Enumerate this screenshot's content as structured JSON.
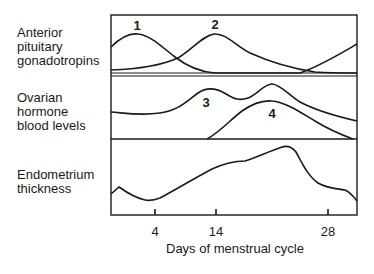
{
  "rows": [
    {
      "name": "anterior-pituitary",
      "lines": [
        "Anterior",
        "pituitary",
        "gonadotropins"
      ]
    },
    {
      "name": "ovarian-hormone",
      "lines": [
        "Ovarian",
        "hormone",
        "blood levels"
      ]
    },
    {
      "name": "endometrium",
      "lines": [
        "Endometrium",
        "thickness"
      ]
    }
  ],
  "curve_labels": [
    "1",
    "2",
    "3",
    "4"
  ],
  "x_axis": {
    "label": "Days of menstrual cycle",
    "ticks": [
      "4",
      "14",
      "28"
    ]
  },
  "colors": {
    "line": "#1a1a1a",
    "background": "#ffffff"
  }
}
